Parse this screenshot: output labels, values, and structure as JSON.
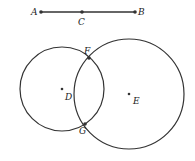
{
  "segment": {
    "points": [
      {
        "label": "A",
        "x": 41,
        "y": 12,
        "lx": 31,
        "ly": 15
      },
      {
        "label": "C",
        "x": 82,
        "y": 12,
        "lx": 78,
        "ly": 25
      },
      {
        "label": "B",
        "x": 135,
        "y": 12,
        "lx": 138,
        "ly": 15
      }
    ]
  },
  "circles": [
    {
      "center_label": "D",
      "cx": 62,
      "cy": 89,
      "r": 42,
      "lx": 65,
      "ly": 100
    },
    {
      "center_label": "E",
      "cx": 129,
      "cy": 94,
      "r": 55,
      "lx": 133,
      "ly": 104
    }
  ],
  "intersections": [
    {
      "label": "F",
      "x": 89,
      "y": 58,
      "lx": 84,
      "ly": 54
    },
    {
      "label": "G",
      "x": 85,
      "y": 124,
      "lx": 79,
      "ly": 134
    }
  ],
  "colors": {
    "stroke": "#333333"
  }
}
